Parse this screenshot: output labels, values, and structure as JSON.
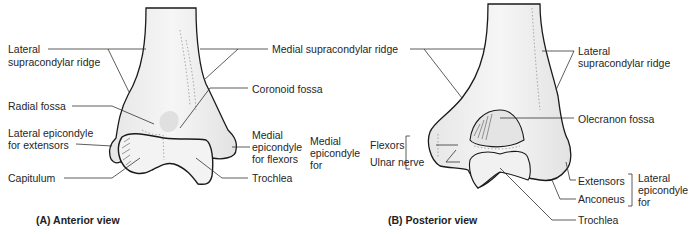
{
  "figure": {
    "panels": [
      {
        "id": "A",
        "caption": "(A) Anterior view",
        "labels": {
          "lateral_supracondylar_ridge_1": "Lateral",
          "lateral_supracondylar_ridge_2": "supracondylar ridge",
          "radial_fossa": "Radial fossa",
          "lateral_epicondyle_1": "Lateral epicondyle",
          "lateral_epicondyle_2": "for extensors",
          "capitulum": "Capitulum",
          "medial_supracondylar_ridge": "Medial supracondylar ridge",
          "coronoid_fossa": "Coronoid fossa",
          "medial_epicondyle_1": "Medial",
          "medial_epicondyle_2": "epicondyle",
          "medial_epicondyle_3": "for flexors",
          "trochlea": "Trochlea"
        }
      },
      {
        "id": "B",
        "caption": "(B) Posterior view",
        "labels": {
          "lateral_supracondylar_ridge_1": "Lateral",
          "lateral_supracondylar_ridge_2": "supracondylar ridge",
          "olecranon_fossa": "Olecranon fossa",
          "medial_epicondyle_1": "Medial",
          "medial_epicondyle_2": "epicondyle",
          "medial_epicondyle_3": "for",
          "flexors": "Flexors",
          "ulnar_nerve": "Ulnar nerve",
          "extensors": "Extensors",
          "anconeus": "Anconeus",
          "lateral_epicondyle_1": "Lateral",
          "lateral_epicondyle_2": "epicondyle",
          "lateral_epicondyle_3": "for",
          "trochlea": "Trochlea"
        }
      }
    ],
    "colors": {
      "bone_fill": "#efefef",
      "bone_outline": "#1a1a1a",
      "leader_line": "#333333",
      "text": "#262626"
    }
  }
}
